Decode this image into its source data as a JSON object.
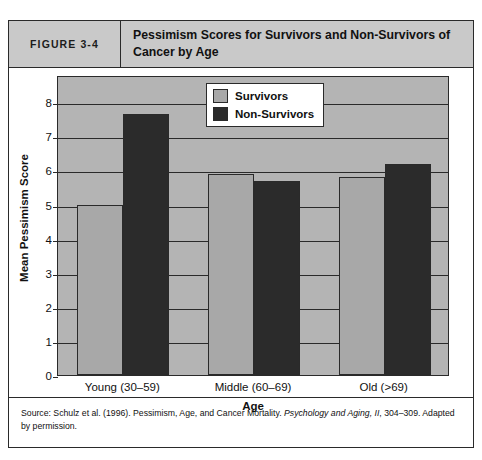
{
  "figure": {
    "number_label": "FIGURE 3-4",
    "title": "Pessimism Scores for Survivors and Non-Survivors of Cancer by Age"
  },
  "source": {
    "prefix": "Source: Schulz et al. (1996). Pessimism, Age, and Cancer Mortality. ",
    "journal": "Psychology and Aging, II",
    "suffix": ", 304–309. Adapted by permission."
  },
  "chart_data": {
    "type": "bar",
    "title": "Pessimism Scores for Survivors and Non-Survivors of Cancer by Age",
    "categories": [
      "Young (30–59)",
      "Middle (60–69)",
      "Old (>69)"
    ],
    "series": [
      {
        "name": "Survivors",
        "color": "#a8a8a8",
        "values": [
          5.0,
          5.9,
          5.8
        ]
      },
      {
        "name": "Non-Survivors",
        "color": "#2b2b2b",
        "values": [
          7.65,
          5.7,
          6.2
        ]
      }
    ],
    "xlabel": "Age",
    "ylabel": "Mean Pessimism Score",
    "ylim": [
      0,
      8.8
    ],
    "yticks": [
      0,
      1,
      2,
      3,
      4,
      5,
      6,
      7,
      8
    ],
    "ytick_labels": [
      "0",
      "1",
      "2",
      "3",
      "4",
      "5",
      "6",
      "7",
      "8"
    ],
    "grid": true,
    "legend_position": "top-center",
    "plot_background": "#b4b4b4"
  }
}
